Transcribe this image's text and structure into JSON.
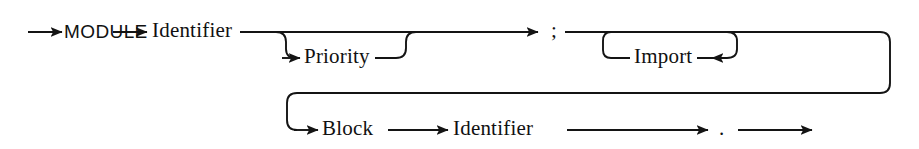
{
  "diagram": {
    "kind": "railroad-syntax-diagram",
    "title": "Module",
    "background_color": "#ffffff",
    "line_color": "#141414",
    "text_color": "#111111",
    "nodes": [
      {
        "id": "module",
        "label": "MODULE",
        "type": "terminal",
        "x": 47,
        "y": 32,
        "style": "word"
      },
      {
        "id": "identifier1",
        "label": "Identifier",
        "type": "nonterminal",
        "x": 151,
        "y": 32,
        "style": "word"
      },
      {
        "id": "priority",
        "label": "Priority",
        "type": "nonterminal",
        "x": 304,
        "y": 58,
        "style": "word"
      },
      {
        "id": "semicolon",
        "label": ";",
        "type": "terminal",
        "x": 551,
        "y": 32,
        "style": "punct"
      },
      {
        "id": "import",
        "label": "Import",
        "type": "nonterminal",
        "x": 638,
        "y": 58,
        "style": "word"
      },
      {
        "id": "block",
        "label": "Block",
        "type": "nonterminal",
        "x": 322,
        "y": 130,
        "style": "word"
      },
      {
        "id": "identifier2",
        "label": "Identifier",
        "type": "nonterminal",
        "x": 452,
        "y": 130,
        "style": "word"
      },
      {
        "id": "period",
        "label": ".",
        "type": "terminal",
        "x": 720,
        "y": 130,
        "style": "punct"
      }
    ],
    "paths": {
      "entry": "start stub arrow into MODULE",
      "main_row_y": 32,
      "branch_row_y": 58,
      "wrap_row_y": 93,
      "bottom_row_y": 130,
      "optional_branch": "Priority",
      "repeat_loop": "Import",
      "exit": "final arrow after period"
    },
    "arrows": [
      {
        "id": "arrow-start",
        "x": 62,
        "y": 32,
        "dir": "right"
      },
      {
        "id": "arrow-to-ident1",
        "x": 147,
        "y": 32,
        "dir": "right"
      },
      {
        "id": "arrow-to-priority",
        "x": 300,
        "y": 58,
        "dir": "right"
      },
      {
        "id": "arrow-to-semicolon",
        "x": 538,
        "y": 32,
        "dir": "right"
      },
      {
        "id": "arrow-import-loop",
        "x": 712,
        "y": 58,
        "dir": "left"
      },
      {
        "id": "arrow-to-block",
        "x": 318,
        "y": 130,
        "dir": "right"
      },
      {
        "id": "arrow-to-ident2",
        "x": 448,
        "y": 130,
        "dir": "right"
      },
      {
        "id": "arrow-to-period",
        "x": 708,
        "y": 130,
        "dir": "right"
      },
      {
        "id": "arrow-exit",
        "x": 812,
        "y": 130,
        "dir": "right"
      }
    ]
  }
}
